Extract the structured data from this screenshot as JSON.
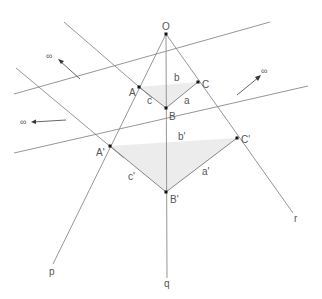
{
  "diagram": {
    "type": "projective-geometry-perspective-triangles",
    "points": {
      "O": {
        "label": "O",
        "x": 166,
        "y": 34
      },
      "A": {
        "label": "A",
        "x": 139,
        "y": 87
      },
      "B": {
        "label": "B",
        "x": 166,
        "y": 108
      },
      "C": {
        "label": "C",
        "x": 198,
        "y": 82
      },
      "A2": {
        "label": "A'",
        "x": 110,
        "y": 146
      },
      "B2": {
        "label": "B'",
        "x": 166,
        "y": 192
      },
      "C2": {
        "label": "C'",
        "x": 237,
        "y": 138
      }
    },
    "sides": {
      "a": "a",
      "b": "b",
      "c": "c",
      "a2": "a'",
      "b2": "b'",
      "c2": "c'"
    },
    "lines": {
      "p": "p",
      "q": "q",
      "r": "r"
    },
    "infinity_markers": [
      {
        "label": "∞",
        "direction": "upper-left"
      },
      {
        "label": "∞",
        "direction": "left"
      },
      {
        "label": "∞",
        "direction": "upper-right"
      }
    ],
    "colors": {
      "line": "#8a8a8a",
      "triangle_fill": "#ececec",
      "point": "#111111",
      "label": "#555555"
    }
  }
}
